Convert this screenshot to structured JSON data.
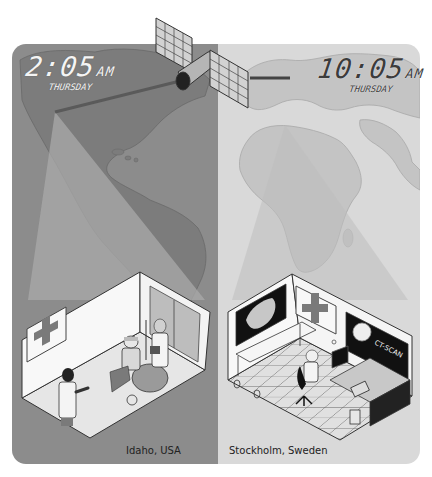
{
  "illustration": {
    "subject": "Telemedicine via satellite link between two hospitals",
    "left_panel": {
      "clock": {
        "time": "2:05",
        "ampm": "AM",
        "day": "THURSDAY"
      },
      "location": "Idaho, USA",
      "scene": "Night-time clinic room with doctor, patient in wheelchair with head bandage, nurse holding clipboard",
      "background_color": "#8c8c8c",
      "map_region": "North & South America"
    },
    "right_panel": {
      "clock": {
        "time": "10:05",
        "ampm": "AM",
        "day": "THURSDAY"
      },
      "location": "Stockholm, Sweden",
      "scene": "Daytime remote diagnostics room with radiologist at computer, X-ray screen, CT-SCAN monitor, telephone",
      "background_color": "#d6d6d6",
      "map_region": "Europe & Africa",
      "monitor_label": "CT-SCAN"
    },
    "satellite": {
      "label": "Communications satellite"
    },
    "colors": {
      "left_bg": "#8c8c8c",
      "left_land": "#7e7e7e",
      "right_bg": "#d9d9d9",
      "right_land": "#c4c4c4",
      "beam_left": "#a9a9a9",
      "beam_right": "#c9c9c9",
      "wall": "#f7f7f7",
      "floor": "#e2e2e2",
      "outline": "#333333",
      "cross": "#7a7a7a",
      "screen": "#111111"
    }
  }
}
